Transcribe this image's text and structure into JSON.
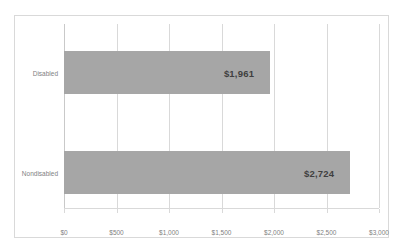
{
  "chart_data": {
    "type": "bar",
    "orientation": "horizontal",
    "title": "",
    "xlabel": "",
    "ylabel": "",
    "categories": [
      "Disabled",
      "Nondisabled"
    ],
    "values": [
      1961,
      2724
    ],
    "value_labels": [
      "$1,961",
      "$2,724"
    ],
    "xlim": [
      0,
      3000
    ],
    "xticks": [
      0,
      500,
      1000,
      1500,
      2000,
      2500,
      3000
    ],
    "xtick_labels": [
      "$0",
      "$500",
      "$1,000",
      "$1,500",
      "$2,000",
      "$2,500",
      "$3,000"
    ],
    "grid": true,
    "legend": false,
    "series": [
      {
        "name": "",
        "values": [
          1961,
          2724
        ],
        "color": "#a6a6a6"
      }
    ],
    "colors": {
      "bar_fill": "#a6a6a6",
      "gridline": "#d9d9d9",
      "border": "#d9d9d9",
      "tick_text": "#7f7f7f",
      "value_text": "#3f3f3f",
      "background": "#ffffff"
    }
  }
}
